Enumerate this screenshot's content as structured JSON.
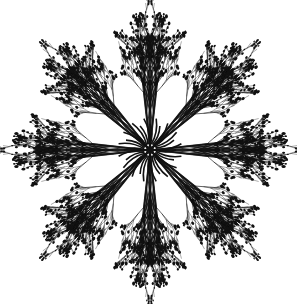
{
  "image": {
    "subject": "kaleidoscopic mandala of bare tree branches with small buds",
    "width": 297,
    "height": 304,
    "background_color": "#ffffff",
    "ink_color": "#111111",
    "center": [
      150,
      150
    ],
    "symmetry_folds": 8,
    "radius": 128
  }
}
